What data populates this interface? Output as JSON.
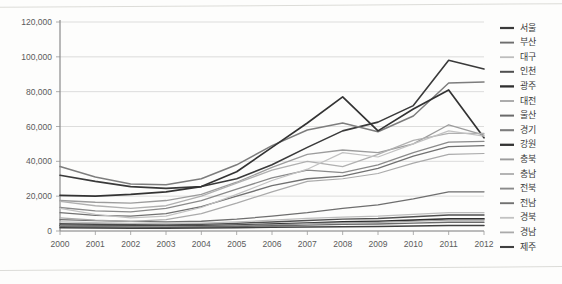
{
  "chart_data": {
    "type": "line",
    "title": "",
    "subtitle": "",
    "xlabel": "",
    "ylabel": "",
    "x": [
      2000,
      2001,
      2002,
      2003,
      2004,
      2005,
      2006,
      2007,
      2008,
      2009,
      2010,
      2011,
      2012
    ],
    "xtick_labels": [
      "2000",
      "2001",
      "2002",
      "2003",
      "2004",
      "2005",
      "2006",
      "2007",
      "2008",
      "2009",
      "2010",
      "2011",
      "2012"
    ],
    "ytick_labels": [
      "0",
      "20,000",
      "40,000",
      "60,000",
      "80,000",
      "100,000",
      "120,000"
    ],
    "ytick_values": [
      0,
      20000,
      40000,
      60000,
      80000,
      100000,
      120000
    ],
    "ylim": [
      0,
      120000
    ],
    "xlim": [
      2000,
      2012
    ],
    "grid": "horizontal",
    "legend_position": "right",
    "series": [
      {
        "name": "서울",
        "color": "#3a3a3a",
        "width": 1.6,
        "values": [
          32000,
          28500,
          25500,
          24500,
          25500,
          30000,
          38000,
          48000,
          57500,
          62500,
          72000,
          98000,
          93000
        ]
      },
      {
        "name": "부산",
        "color": "#6e6e6e",
        "width": 1.3,
        "values": [
          6500,
          6000,
          5500,
          5200,
          5600,
          6800,
          8500,
          10500,
          13000,
          15000,
          18500,
          22500,
          22500
        ]
      },
      {
        "name": "대구",
        "color": "#bdbdbd",
        "width": 1.2,
        "values": [
          5200,
          4800,
          4400,
          4200,
          4500,
          5200,
          6200,
          7200,
          8000,
          8500,
          9500,
          10500,
          10500
        ]
      },
      {
        "name": "인천",
        "color": "#4f4f4f",
        "width": 1.4,
        "values": [
          4200,
          3900,
          3600,
          3500,
          3800,
          4400,
          5200,
          6000,
          6800,
          7200,
          8200,
          9200,
          9200
        ]
      },
      {
        "name": "광주",
        "color": "#2f2f2f",
        "width": 1.7,
        "values": [
          3300,
          3100,
          2900,
          2800,
          3000,
          3400,
          4000,
          4600,
          5200,
          5600,
          6300,
          7000,
          7000
        ]
      },
      {
        "name": "대전",
        "color": "#a3a3a3",
        "width": 1.2,
        "values": [
          3000,
          2800,
          2600,
          2500,
          2700,
          3100,
          3600,
          4200,
          4700,
          5000,
          5600,
          6200,
          6200
        ]
      },
      {
        "name": "울산",
        "color": "#6a6a6a",
        "width": 1.4,
        "values": [
          2500,
          2300,
          2200,
          2100,
          2300,
          2600,
          3000,
          3400,
          3800,
          4000,
          4500,
          5000,
          5000
        ]
      },
      {
        "name": "경기",
        "color": "#7d7d7d",
        "width": 1.5,
        "values": [
          37000,
          31000,
          27000,
          26500,
          30000,
          38000,
          49000,
          58000,
          62000,
          57000,
          66000,
          85000,
          85500
        ]
      },
      {
        "name": "강원",
        "color": "#333333",
        "width": 1.7,
        "values": [
          20500,
          20000,
          21000,
          22500,
          25500,
          34000,
          48000,
          62000,
          77000,
          57500,
          70000,
          81000,
          53500
        ]
      },
      {
        "name": "충북",
        "color": "#9c9c9c",
        "width": 1.3,
        "values": [
          17500,
          16500,
          16000,
          17500,
          21000,
          28000,
          36500,
          44000,
          46500,
          45000,
          50000,
          61000,
          55000
        ]
      },
      {
        "name": "충남",
        "color": "#b0b0b0",
        "width": 1.3,
        "values": [
          17000,
          14500,
          13000,
          14500,
          20000,
          27500,
          35000,
          40000,
          37000,
          44000,
          52000,
          56000,
          56000
        ]
      },
      {
        "name": "전북",
        "color": "#8a8a8a",
        "width": 1.3,
        "values": [
          13500,
          11500,
          11000,
          13000,
          17500,
          24000,
          30500,
          35000,
          33500,
          38000,
          45000,
          51000,
          51500
        ]
      },
      {
        "name": "전남",
        "color": "#717171",
        "width": 1.3,
        "values": [
          10500,
          9000,
          8500,
          10000,
          14000,
          20000,
          26000,
          30000,
          31500,
          36000,
          43000,
          48500,
          49000
        ]
      },
      {
        "name": "경북",
        "color": "#c2c2c2",
        "width": 1.2,
        "values": [
          13000,
          9500,
          7500,
          8500,
          13500,
          21000,
          29000,
          35500,
          45000,
          42500,
          50000,
          57500,
          54500
        ]
      },
      {
        "name": "경남",
        "color": "#aaaaaa",
        "width": 1.2,
        "values": [
          7500,
          6200,
          5500,
          6500,
          10000,
          16000,
          22500,
          28500,
          30000,
          33000,
          39000,
          44000,
          44500
        ]
      },
      {
        "name": "제주",
        "color": "#404040",
        "width": 1.5,
        "values": [
          1800,
          1700,
          1600,
          1600,
          1700,
          1900,
          2100,
          2300,
          2500,
          2600,
          2900,
          3200,
          3200
        ]
      }
    ]
  }
}
